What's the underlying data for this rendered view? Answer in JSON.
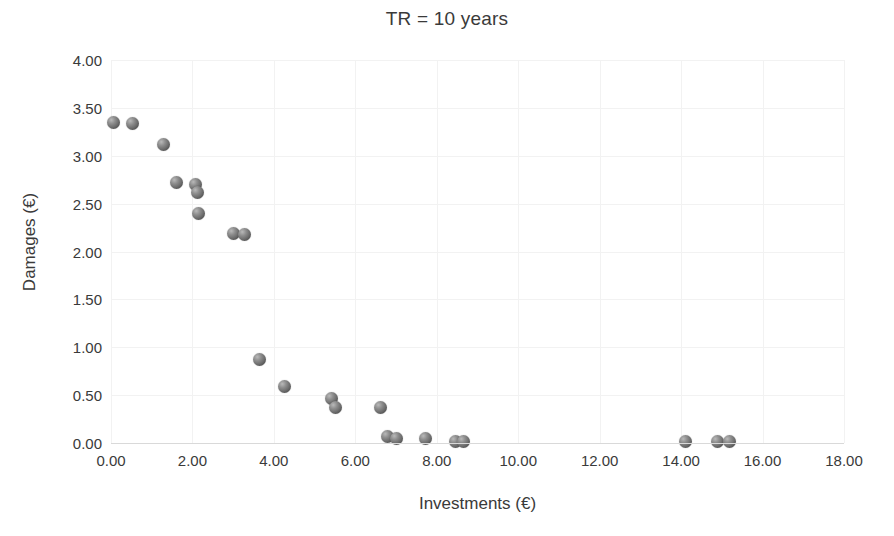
{
  "chart_data": {
    "type": "scatter",
    "title": "TR = 10 years",
    "xlabel": "Investments (€)",
    "ylabel": "Damages (€)",
    "xlim": [
      0,
      18
    ],
    "ylim": [
      0,
      4
    ],
    "xticks": [
      "0.00",
      "2.00",
      "4.00",
      "6.00",
      "8.00",
      "10.00",
      "12.00",
      "14.00",
      "16.00",
      "18.00"
    ],
    "xtick_values": [
      0,
      2,
      4,
      6,
      8,
      10,
      12,
      14,
      16,
      18
    ],
    "yticks": [
      "0.00",
      "0.50",
      "1.00",
      "1.50",
      "2.00",
      "2.50",
      "3.00",
      "3.50",
      "4.00"
    ],
    "ytick_values": [
      0,
      0.5,
      1,
      1.5,
      2,
      2.5,
      3,
      3.5,
      4
    ],
    "grid": true,
    "legend": null,
    "marker_color": "#6e6e6e",
    "series": [
      {
        "name": "Investments vs Damages",
        "points": [
          [
            0.05,
            3.35
          ],
          [
            0.52,
            3.34
          ],
          [
            1.3,
            3.12
          ],
          [
            1.62,
            2.72
          ],
          [
            2.08,
            2.7
          ],
          [
            2.13,
            2.62
          ],
          [
            2.15,
            2.4
          ],
          [
            3.02,
            2.19
          ],
          [
            3.28,
            2.18
          ],
          [
            3.65,
            0.87
          ],
          [
            4.25,
            0.59
          ],
          [
            5.42,
            0.46
          ],
          [
            5.52,
            0.37
          ],
          [
            6.62,
            0.37
          ],
          [
            6.78,
            0.07
          ],
          [
            7.02,
            0.05
          ],
          [
            7.72,
            0.05
          ],
          [
            8.45,
            0.02
          ],
          [
            8.65,
            0.02
          ],
          [
            14.1,
            0.02
          ],
          [
            14.9,
            0.02
          ],
          [
            15.2,
            0.02
          ]
        ]
      }
    ]
  }
}
